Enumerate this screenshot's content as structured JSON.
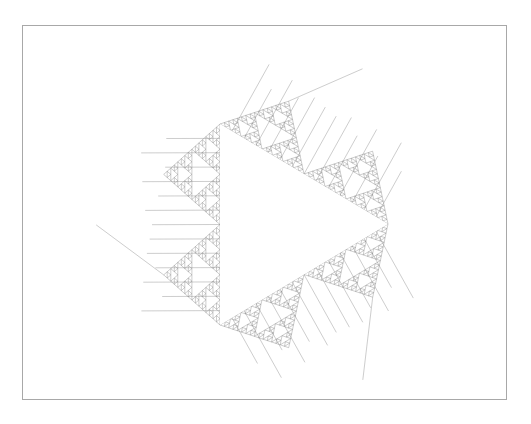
{
  "figure": {
    "frame_color": "#a8a8a8",
    "line_color": "#7a7a7a",
    "central_triangle": {
      "vertices": [
        [
          220,
          124
        ],
        [
          388,
          224
        ],
        [
          220,
          325
        ]
      ]
    },
    "depth": 5
  }
}
